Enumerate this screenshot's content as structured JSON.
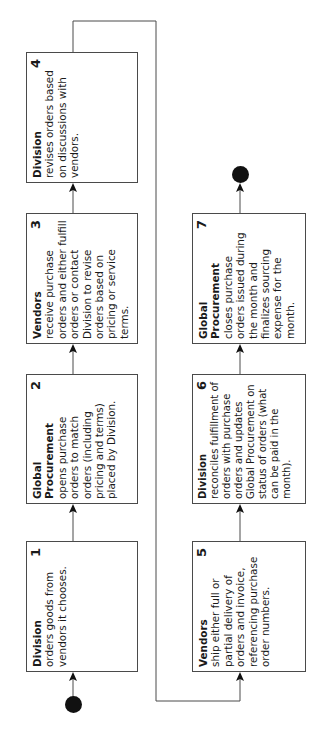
{
  "diagram": {
    "orientation": "rotated -90deg (text reads bottom to top)",
    "start_marker": "start-dot",
    "end_marker": "end-dot",
    "colors": {
      "line": "#4a4a4a",
      "dot": "#111111",
      "box_fill": "#ffffff"
    },
    "steps": [
      {
        "num": "1",
        "actor": "Division",
        "desc": "orders goods from vendors it chooses."
      },
      {
        "num": "2",
        "actor": "Global Procurement",
        "desc": "opens purchase orders to match orders (including pricing and terms) placed by Division."
      },
      {
        "num": "3",
        "actor": "Vendors",
        "desc": "receive purchase orders and either fulfill orders or contact Division to revise orders based on pricing or service terms."
      },
      {
        "num": "4",
        "actor": "Division",
        "desc": "revises orders based on discussions with vendors."
      },
      {
        "num": "5",
        "actor": "Vendors",
        "desc": "ship either full or partial delivery of orders and invoice, referencing purchase order numbers."
      },
      {
        "num": "6",
        "actor": "Division",
        "desc": "reconciles fulfillment of orders with purchase orders and updates Global Procurement on status of orders (what can be paid in the month)."
      },
      {
        "num": "7",
        "actor": "Global Procurement",
        "desc": "closes purchase orders issued during the month and finalizes sourcing expense for the month."
      }
    ],
    "flow": [
      "start",
      "1",
      "2",
      "3",
      "4",
      "5",
      "6",
      "7",
      "end"
    ]
  }
}
